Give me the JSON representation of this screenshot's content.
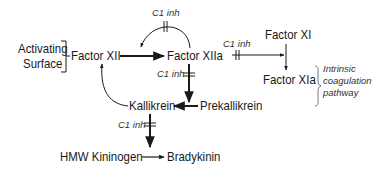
{
  "diagram": {
    "nodes": {
      "activating_surface_line1": "Activating",
      "activating_surface_line2": "Surface",
      "factor_xii": "Factor XII",
      "factor_xiia": "Factor XIIa",
      "factor_xi": "Factor XI",
      "factor_xia": "Factor XIa",
      "prekallikrein": "Prekallikrein",
      "kallikrein": "Kallikrein",
      "hmw_kininogen": "HMW Kininogen",
      "bradykinin": "Bradykinin"
    },
    "inhibitor_labels": {
      "top_loop": "C1 inh",
      "xiia_to_xi": "C1 inh",
      "xiia_to_prekallikrein": "C1 inh",
      "kallikrein_to_kininogen": "C1 inh"
    },
    "pathway_note": {
      "line1": "Intrinsic",
      "line2": "coagulation",
      "line3": "pathway"
    },
    "edges": [
      {
        "from": "Factor XII",
        "to": "Factor XIIa"
      },
      {
        "from": "Factor XIIa",
        "to": "Factor XII",
        "inhibited_by": "C1 inh"
      },
      {
        "from": "Factor XIIa",
        "to": "Factor XI→XIa",
        "inhibited_by": "C1 inh"
      },
      {
        "from": "Factor XI",
        "to": "Factor XIa"
      },
      {
        "from": "Factor XIIa",
        "to": "Prekallikrein→Kallikrein",
        "inhibited_by": "C1 inh"
      },
      {
        "from": "Prekallikrein",
        "to": "Kallikrein"
      },
      {
        "from": "Kallikrein",
        "to": "Factor XII"
      },
      {
        "from": "Kallikrein",
        "to": "HMW Kininogen→Bradykinin",
        "inhibited_by": "C1 inh"
      },
      {
        "from": "HMW Kininogen",
        "to": "Bradykinin"
      }
    ]
  }
}
